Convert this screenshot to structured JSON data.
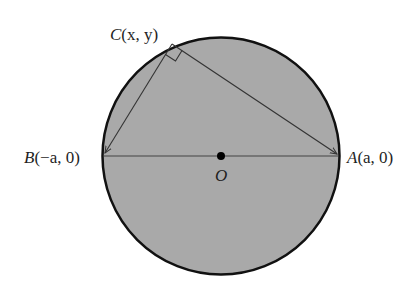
{
  "figure": {
    "colors": {
      "circle_fill": "#a9a9a9",
      "stroke": "#111111",
      "line": "#444444",
      "background": "#ffffff"
    },
    "labels": {
      "C": {
        "name": "C",
        "coords": "(x, y)"
      },
      "B": {
        "name": "B",
        "coords": "(−a, 0)"
      },
      "A": {
        "name": "A",
        "coords": "(a, 0)"
      },
      "O": {
        "name": "O"
      }
    }
  }
}
